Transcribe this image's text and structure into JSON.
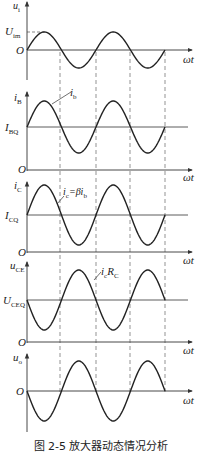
{
  "figure": {
    "caption": "图 2-5   放大器动态情况分析",
    "x_axis_label": "ωt",
    "origin_label": "O",
    "dashed_guide_x": [
      60,
      96,
      130,
      165
    ]
  },
  "panels": [
    {
      "id": "ui",
      "y_label": "u",
      "y_label_sub": "i",
      "level_label": "U",
      "level_label_sub": "im",
      "level_kind": "amplitude",
      "waveform": "sine",
      "phase": "in-phase",
      "annotation": ""
    },
    {
      "id": "iB",
      "y_label": "i",
      "y_label_sub": "B",
      "level_label": "I",
      "level_label_sub": "BQ",
      "level_kind": "dc-offset",
      "waveform": "sine",
      "phase": "in-phase",
      "annotation": "i",
      "annotation_sub": "b"
    },
    {
      "id": "iC",
      "y_label": "i",
      "y_label_sub": "C",
      "level_label": "I",
      "level_label_sub": "CQ",
      "level_kind": "dc-offset",
      "waveform": "sine",
      "phase": "in-phase",
      "annotation": "i",
      "annotation_sub": "c",
      "annotation_rest": "=βi",
      "annotation_rest_sub": "b"
    },
    {
      "id": "uCE",
      "y_label": "u",
      "y_label_sub": "CE",
      "level_label": "U",
      "level_label_sub": "CEQ",
      "level_kind": "dc-offset",
      "waveform": "sine",
      "phase": "inverted",
      "annotation": "i",
      "annotation_sub": "c",
      "annotation_rest": "R",
      "annotation_rest_sub": "C"
    },
    {
      "id": "uo",
      "y_label": "u",
      "y_label_sub": "o",
      "level_label": "",
      "level_label_sub": "",
      "level_kind": "zero",
      "waveform": "sine",
      "phase": "inverted",
      "annotation": ""
    }
  ]
}
